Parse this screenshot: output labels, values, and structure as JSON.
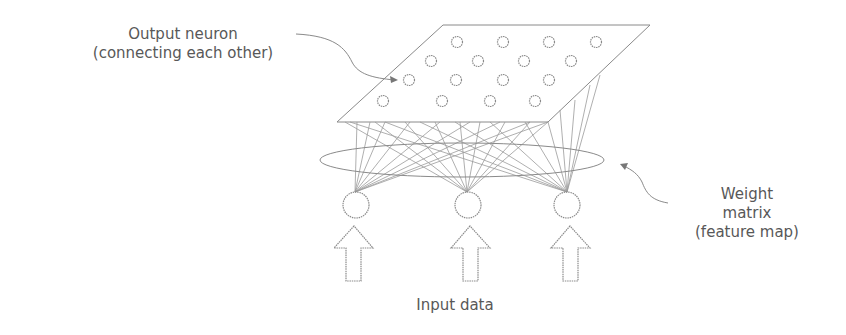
{
  "diagram": {
    "type": "neural-network-schematic",
    "labels": {
      "output_neuron_line1": "Output neuron",
      "output_neuron_line2": "(connecting each other)",
      "weight_line1": "Weight",
      "weight_line2": "matrix",
      "weight_line3": "(feature map)",
      "input": "Input data"
    },
    "layers": {
      "output_layer": {
        "shape": "parallelogram",
        "neurons": 16,
        "rows": 4,
        "per_row": 4
      },
      "input_layer": {
        "neurons": 3
      }
    },
    "colors": {
      "stroke": "#8a8a8a",
      "text": "#585858",
      "background": "#ffffff"
    }
  }
}
